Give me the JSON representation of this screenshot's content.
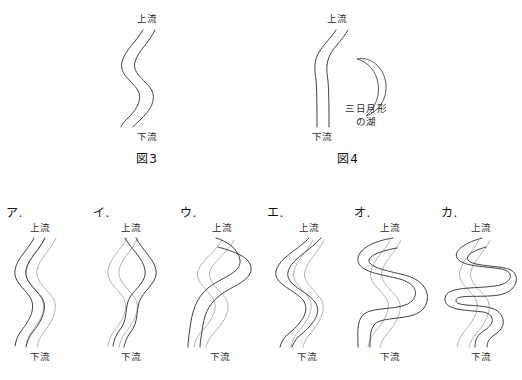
{
  "document": {
    "language": "ja",
    "subject": "river-meandering-and-oxbow-lake",
    "background_color": "#ffffff",
    "ink_color": "#3f3f46",
    "old_course_color": "#b4b4b8"
  },
  "top_figures": [
    {
      "id": "fig3",
      "caption": "図3",
      "upstream_label": "上流",
      "downstream_label": "下流",
      "description": "meandering-river"
    },
    {
      "id": "fig4",
      "caption": "図4",
      "upstream_label": "上流",
      "downstream_label": "下流",
      "lake_label_line1": "三日月形",
      "lake_label_line2": "の湖",
      "description": "straightened-river-with-oxbow-lake"
    }
  ],
  "options": [
    {
      "id": "a",
      "letter": "ア.",
      "upstream_label": "上流",
      "downstream_label": "下流",
      "description": "same-meander-shifted-sideways"
    },
    {
      "id": "b",
      "letter": "イ.",
      "upstream_label": "上流",
      "downstream_label": "下流",
      "description": "mirrored-crossing-meander"
    },
    {
      "id": "c",
      "letter": "ウ.",
      "upstream_label": "上流",
      "downstream_label": "下流",
      "description": "meander-shifted-downstream"
    },
    {
      "id": "d",
      "letter": "エ.",
      "upstream_label": "上流",
      "downstream_label": "下流",
      "description": "meander-widened-left"
    },
    {
      "id": "e",
      "letter": "オ.",
      "upstream_label": "上流",
      "downstream_label": "下流",
      "description": "amplified-meander-bends"
    },
    {
      "id": "f",
      "letter": "カ.",
      "upstream_label": "上流",
      "downstream_label": "下流",
      "description": "extreme-looping-meander"
    }
  ]
}
